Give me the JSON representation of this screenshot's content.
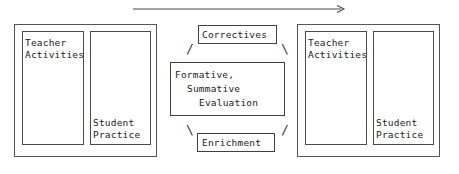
{
  "diagram": {
    "background_color": "#ffffff",
    "line_color": "#4a4a4a",
    "text_color": "#1a1a1a"
  },
  "flow_arrow": {
    "name": "progression-arrow",
    "direction": "left-to-right",
    "x_start": 133,
    "x_end": 346,
    "y": 9
  },
  "left_unit": {
    "panel_label": "instructional-unit-one",
    "teacher_box": {
      "line1": "Teacher",
      "line2": "Activities"
    },
    "student_box": {
      "line1": "Student",
      "line2": "Practice"
    }
  },
  "right_unit": {
    "panel_label": "instructional-unit-two",
    "teacher_box": {
      "line1": "Teacher",
      "line2": "Activities"
    },
    "student_box": {
      "line1": "Student",
      "line2": "Practice"
    }
  },
  "center_cycle": {
    "correctives": "Correctives",
    "enrichment": "Enrichment",
    "evaluation": {
      "line1": "Formative,",
      "line2": "Summative",
      "line3": "Evaluation"
    },
    "connectors": {
      "top_left": "/",
      "top_right": "\\",
      "bottom_left": "\\",
      "bottom_right": "/"
    }
  }
}
